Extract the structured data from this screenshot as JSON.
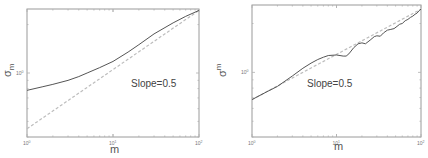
{
  "chart_data": [
    {
      "type": "line",
      "title": "",
      "xlabel": "m",
      "ylabel": "σ_m",
      "xscale": "log",
      "yscale": "log",
      "xlim": [
        1,
        100
      ],
      "ylim": [
        0.4,
        2.5
      ],
      "x_ticks": [
        1,
        10,
        100
      ],
      "x_tick_labels": [
        "10^0",
        "10^1",
        "10^2"
      ],
      "y_ticks": [
        1
      ],
      "y_tick_labels": [
        "10^0"
      ],
      "grid": false,
      "annotation": "Slope=0.5",
      "series": [
        {
          "name": "sigma_m",
          "style": "solid",
          "x": [
            1,
            1.5,
            2,
            3,
            4,
            5,
            7,
            10,
            15,
            20,
            30,
            50,
            70,
            100
          ],
          "y": [
            0.78,
            0.82,
            0.85,
            0.9,
            0.95,
            1.0,
            1.08,
            1.18,
            1.35,
            1.5,
            1.75,
            2.05,
            2.25,
            2.45
          ]
        },
        {
          "name": "slope-0.5-reference",
          "style": "dashed",
          "x": [
            1,
            100
          ],
          "y": [
            0.45,
            2.45
          ]
        }
      ]
    },
    {
      "type": "line",
      "title": "",
      "xlabel": "m",
      "ylabel": "σ_m",
      "xscale": "log",
      "yscale": "log",
      "xlim": [
        1,
        100
      ],
      "ylim": [
        0.4,
        2.6
      ],
      "x_ticks": [
        1,
        10,
        100
      ],
      "x_tick_labels": [
        "10^0",
        "10^1",
        "10^2"
      ],
      "y_ticks": [
        1
      ],
      "y_tick_labels": [
        "10^0"
      ],
      "grid": false,
      "annotation": "Slope=0.5",
      "series": [
        {
          "name": "sigma_m",
          "style": "solid",
          "x": [
            1,
            1.5,
            2,
            3,
            4,
            5,
            6,
            7,
            8,
            10,
            12,
            13,
            14,
            16,
            18,
            20,
            22,
            25,
            28,
            30,
            33,
            36,
            40,
            44,
            48,
            52,
            56,
            60,
            65,
            70,
            75,
            80,
            85,
            90,
            95,
            100
          ],
          "y": [
            0.68,
            0.76,
            0.82,
            0.95,
            1.06,
            1.14,
            1.2,
            1.24,
            1.27,
            1.28,
            1.26,
            1.26,
            1.3,
            1.42,
            1.5,
            1.52,
            1.5,
            1.58,
            1.66,
            1.68,
            1.67,
            1.75,
            1.82,
            1.84,
            1.86,
            1.92,
            1.98,
            2.0,
            2.08,
            2.12,
            2.18,
            2.22,
            2.28,
            2.32,
            2.4,
            2.45
          ]
        },
        {
          "name": "slope-0.5-reference",
          "style": "dashed",
          "x": [
            1,
            100
          ],
          "y": [
            0.68,
            2.45
          ]
        }
      ]
    }
  ]
}
